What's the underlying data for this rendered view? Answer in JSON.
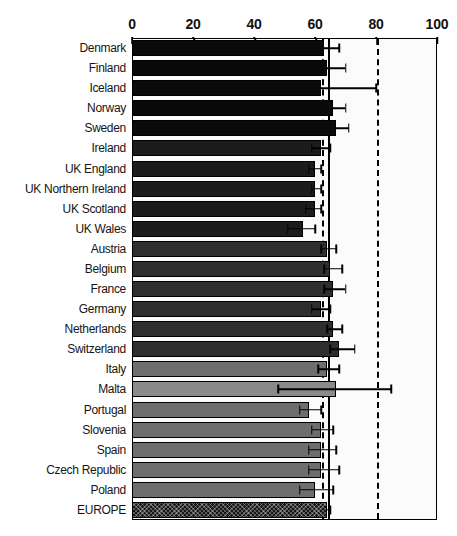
{
  "chart_data": {
    "type": "bar",
    "orientation": "horizontal",
    "title": "",
    "xlabel": "",
    "ylabel": "",
    "xlim": [
      0,
      100
    ],
    "xticks": [
      0,
      20,
      40,
      60,
      80,
      100
    ],
    "xtick_labels": [
      "0",
      "20",
      "40",
      "60",
      "80",
      "100"
    ],
    "grid": false,
    "legend": "none",
    "reference_lines": [
      {
        "name": "europe-average-dashed",
        "value": 62,
        "style": "dashed"
      },
      {
        "name": "europe-average-solid",
        "value": 64,
        "style": "solid"
      },
      {
        "name": "target-80-dashed",
        "value": 80,
        "style": "dashed"
      }
    ],
    "categories": [
      "Denmark",
      "Finland",
      "Iceland",
      "Norway",
      "Sweden",
      "Ireland",
      "UK England",
      "UK Northern Ireland",
      "UK Scotland",
      "UK Wales",
      "Austria",
      "Belgium",
      "France",
      "Germany",
      "Netherlands",
      "Switzerland",
      "Italy",
      "Malta",
      "Portugal",
      "Slovenia",
      "Spain",
      "Czech Republic",
      "Poland",
      "EUROPE"
    ],
    "values": [
      63,
      64,
      62,
      66,
      67,
      62,
      60,
      60,
      60,
      56,
      64,
      65,
      66,
      62,
      66,
      68,
      64,
      67,
      58,
      62,
      62,
      62,
      60,
      64
    ],
    "error_low": [
      63,
      64,
      62,
      66,
      67,
      59,
      58,
      59,
      57,
      51,
      62,
      63,
      63,
      59,
      64,
      65,
      61,
      48,
      55,
      59,
      58,
      58,
      55,
      64
    ],
    "error_high": [
      68,
      70,
      80,
      70,
      71,
      65,
      62,
      62,
      62,
      60,
      67,
      69,
      70,
      65,
      69,
      73,
      68,
      85,
      62,
      66,
      67,
      68,
      66,
      65
    ],
    "groups": [
      {
        "name": "nordic",
        "color": "#0a0a0a",
        "members": [
          "Denmark",
          "Finland",
          "Iceland",
          "Norway",
          "Sweden"
        ]
      },
      {
        "name": "uk-ireland",
        "color": "#1c1c1c",
        "members": [
          "Ireland",
          "UK England",
          "UK Northern Ireland",
          "UK Scotland",
          "UK Wales"
        ]
      },
      {
        "name": "western-central",
        "color": "#2e2e2e",
        "members": [
          "Austria",
          "Belgium",
          "France",
          "Germany",
          "Netherlands",
          "Switzerland"
        ]
      },
      {
        "name": "southern-eastern",
        "color": "#6e6e6e",
        "members": [
          "Italy",
          "Malta",
          "Portugal",
          "Slovenia",
          "Spain",
          "Czech Republic",
          "Poland"
        ]
      },
      {
        "name": "europe-total",
        "color": "#161616",
        "members": [
          "EUROPE"
        ]
      }
    ],
    "bar_colors": [
      "#0a0a0a",
      "#0a0a0a",
      "#0a0a0a",
      "#0a0a0a",
      "#0a0a0a",
      "#1c1c1c",
      "#1c1c1c",
      "#1c1c1c",
      "#1c1c1c",
      "#1c1c1c",
      "#2e2e2e",
      "#2e2e2e",
      "#2e2e2e",
      "#2e2e2e",
      "#2e2e2e",
      "#2e2e2e",
      "#6e6e6e",
      "#8a8a8a",
      "#6e6e6e",
      "#6e6e6e",
      "#6e6e6e",
      "#6e6e6e",
      "#6e6e6e",
      "#161616"
    ]
  }
}
